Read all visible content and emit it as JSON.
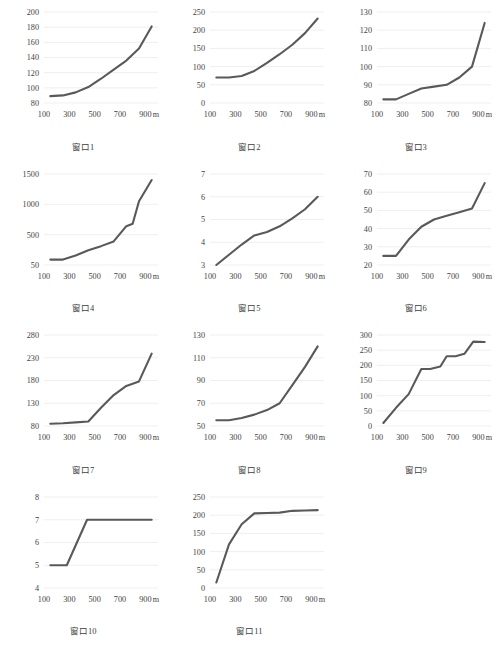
{
  "figure": {
    "panel_count": 11,
    "columns": 3,
    "x_axis_unit_label": "m",
    "x_tick_labels": [
      "100",
      "300",
      "500",
      "700",
      "900"
    ],
    "line_color": "#595959",
    "gridline_color": "#e8e8e8",
    "text_color": "#3f3f3f"
  },
  "chart_data": [
    {
      "type": "line",
      "title": "窗口1",
      "xlabel": "m",
      "ylabel": "",
      "xlim": [
        100,
        1000
      ],
      "ylim": [
        80,
        200
      ],
      "xticks": [
        100,
        300,
        500,
        700,
        900
      ],
      "yticks": [
        80,
        100,
        120,
        140,
        160,
        180,
        200
      ],
      "grid": true,
      "x": [
        150,
        250,
        350,
        450,
        550,
        650,
        750,
        850,
        950
      ],
      "values": [
        89,
        90,
        94,
        101,
        112,
        124,
        136,
        152,
        181
      ]
    },
    {
      "type": "line",
      "title": "窗口2",
      "xlabel": "m",
      "ylabel": "",
      "xlim": [
        100,
        1000
      ],
      "ylim": [
        0,
        250
      ],
      "xticks": [
        100,
        300,
        500,
        700,
        900
      ],
      "yticks": [
        0,
        50,
        100,
        150,
        200,
        250
      ],
      "grid": true,
      "x": [
        150,
        250,
        350,
        450,
        550,
        650,
        750,
        850,
        950
      ],
      "values": [
        70,
        70,
        74,
        88,
        110,
        134,
        160,
        192,
        232
      ]
    },
    {
      "type": "line",
      "title": "窗口3",
      "xlabel": "m",
      "ylabel": "",
      "xlim": [
        100,
        1000
      ],
      "ylim": [
        80,
        130
      ],
      "xticks": [
        100,
        300,
        500,
        700,
        900
      ],
      "yticks": [
        80,
        90,
        100,
        110,
        120,
        130
      ],
      "grid": true,
      "x": [
        150,
        250,
        350,
        450,
        550,
        650,
        750,
        850,
        950
      ],
      "values": [
        82,
        82,
        85,
        88,
        89,
        90,
        94,
        100,
        124
      ]
    },
    {
      "type": "line",
      "title": "窗口4",
      "xlabel": "m",
      "ylabel": "",
      "xlim": [
        100,
        1000
      ],
      "ylim": [
        50,
        1500
      ],
      "xticks": [
        100,
        300,
        500,
        700,
        900
      ],
      "yticks": [
        50,
        500,
        1000,
        1500
      ],
      "ytick_positions_linear": false,
      "grid": true,
      "x": [
        150,
        250,
        350,
        450,
        550,
        650,
        750,
        800,
        850,
        950
      ],
      "values": [
        130,
        130,
        190,
        270,
        330,
        400,
        640,
        680,
        1050,
        1400
      ]
    },
    {
      "type": "line",
      "title": "窗口5",
      "xlabel": "m",
      "ylabel": "",
      "xlim": [
        100,
        1000
      ],
      "ylim": [
        3,
        7
      ],
      "xticks": [
        100,
        300,
        500,
        700,
        900
      ],
      "yticks": [
        3,
        4,
        5,
        6,
        7
      ],
      "grid": true,
      "x": [
        150,
        250,
        350,
        450,
        550,
        650,
        750,
        850,
        950
      ],
      "values": [
        3.0,
        3.45,
        3.9,
        4.3,
        4.45,
        4.7,
        5.05,
        5.45,
        6.0
      ]
    },
    {
      "type": "line",
      "title": "窗口6",
      "xlabel": "m",
      "ylabel": "",
      "xlim": [
        100,
        1000
      ],
      "ylim": [
        20,
        70
      ],
      "xticks": [
        100,
        300,
        500,
        700,
        900
      ],
      "yticks": [
        20,
        30,
        40,
        50,
        60,
        70
      ],
      "grid": true,
      "x": [
        150,
        250,
        350,
        450,
        550,
        650,
        750,
        850,
        950
      ],
      "values": [
        25,
        25,
        34,
        41,
        45,
        47,
        49,
        51,
        65
      ]
    },
    {
      "type": "line",
      "title": "窗口7",
      "xlabel": "m",
      "ylabel": "",
      "xlim": [
        100,
        1000
      ],
      "ylim": [
        80,
        280
      ],
      "xticks": [
        100,
        300,
        500,
        700,
        900
      ],
      "yticks": [
        80,
        130,
        180,
        230,
        280
      ],
      "grid": true,
      "x": [
        150,
        250,
        350,
        450,
        550,
        650,
        750,
        850,
        950
      ],
      "values": [
        85,
        86,
        88,
        90,
        120,
        148,
        168,
        178,
        239
      ]
    },
    {
      "type": "line",
      "title": "窗口8",
      "xlabel": "m",
      "ylabel": "",
      "xlim": [
        100,
        1000
      ],
      "ylim": [
        50,
        130
      ],
      "xticks": [
        100,
        300,
        500,
        700,
        900
      ],
      "yticks": [
        50,
        70,
        90,
        110,
        130
      ],
      "grid": true,
      "x": [
        150,
        250,
        350,
        450,
        550,
        650,
        750,
        850,
        950
      ],
      "values": [
        55,
        55,
        57,
        60,
        64,
        70,
        86,
        102,
        120
      ]
    },
    {
      "type": "line",
      "title": "窗口9",
      "xlabel": "m",
      "ylabel": "",
      "xlim": [
        100,
        1000
      ],
      "ylim": [
        0,
        300
      ],
      "xticks": [
        100,
        300,
        500,
        700,
        900
      ],
      "yticks": [
        0,
        50,
        100,
        150,
        200,
        250,
        300
      ],
      "grid": true,
      "x": [
        150,
        250,
        350,
        450,
        520,
        600,
        650,
        720,
        790,
        860,
        950
      ],
      "values": [
        10,
        60,
        105,
        188,
        188,
        196,
        230,
        230,
        238,
        278,
        277
      ]
    },
    {
      "type": "line",
      "title": "窗口10",
      "xlabel": "m",
      "ylabel": "",
      "xlim": [
        100,
        1000
      ],
      "ylim": [
        4,
        8
      ],
      "xticks": [
        100,
        300,
        500,
        700,
        900
      ],
      "yticks": [
        4,
        5,
        6,
        7,
        8
      ],
      "grid": true,
      "x": [
        150,
        280,
        440,
        950
      ],
      "values": [
        5,
        5,
        7,
        7
      ]
    },
    {
      "type": "line",
      "title": "窗口11",
      "xlabel": "m",
      "ylabel": "",
      "xlim": [
        100,
        1000
      ],
      "ylim": [
        0,
        250
      ],
      "xticks": [
        100,
        300,
        500,
        700,
        900
      ],
      "yticks": [
        0,
        50,
        100,
        150,
        200,
        250
      ],
      "grid": true,
      "x": [
        150,
        250,
        350,
        450,
        550,
        650,
        750,
        850,
        950
      ],
      "values": [
        15,
        120,
        175,
        205,
        206,
        207,
        212,
        213,
        214
      ]
    }
  ]
}
